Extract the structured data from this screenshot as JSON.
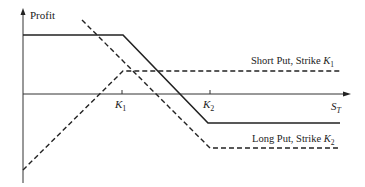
{
  "diagram": {
    "type": "option-payoff-diagram",
    "y_axis_label": "Profit",
    "x_axis_label": {
      "main": "S",
      "sub": "T"
    },
    "ticks": [
      {
        "main": "K",
        "sub": "1"
      },
      {
        "main": "K",
        "sub": "2"
      }
    ],
    "series": [
      {
        "name": "Short Put, Strike K1",
        "label_main": "Short Put, Strike ",
        "label_var": "K",
        "label_sub": "1",
        "style": "dashed"
      },
      {
        "name": "Long Put, Strike K2",
        "label_main": "Long Put, Strike ",
        "label_var": "K",
        "label_sub": "2",
        "style": "dashed"
      },
      {
        "name": "Bear spread (combined)",
        "style": "solid"
      }
    ]
  }
}
